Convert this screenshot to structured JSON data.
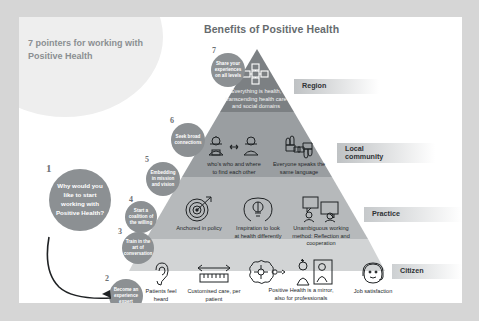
{
  "slide": {
    "deck_title": "Benefits of Positive Health",
    "left_heading": "7 pointers for working with Positive Health"
  },
  "pyramid": {
    "tiers": [
      {
        "id": "region",
        "label": "Region",
        "items": [
          {
            "icon": "network-nodes-icon",
            "caption": "Everything is health, transcending health care and social domains"
          }
        ]
      },
      {
        "id": "local-community",
        "label": "Local\ncommunity",
        "items": [
          {
            "icon": "two-people-icon",
            "caption": "who's who and where to find each other"
          },
          {
            "icon": "four-hands-icon",
            "caption": "Everyone speaks the same language"
          }
        ]
      },
      {
        "id": "practice",
        "label": "Practice",
        "items": [
          {
            "icon": "target-arrow-icon",
            "caption": "Anchored in policy"
          },
          {
            "icon": "head-lightbulb-icon",
            "caption": "Inspiration to look at health differently"
          },
          {
            "icon": "speech-bubbles-icon",
            "caption": "Unambiguous working method: Reflection and cooperation"
          }
        ]
      },
      {
        "id": "citizen",
        "label": "Citizen",
        "items": [
          {
            "icon": "ear-icon",
            "caption": "Patients feel heard"
          },
          {
            "icon": "ruler-arrows-icon",
            "caption": "Customised care, per patient"
          },
          {
            "icon": "brain-mirror-icon",
            "caption": "Positive Health is a mirror, also for professionals"
          },
          {
            "icon": "smiling-headset-face-icon",
            "caption": "Job satisfaction"
          }
        ]
      }
    ]
  },
  "pointers": [
    {
      "number": "1",
      "text": "Why would you like to start working with Positive Health?"
    },
    {
      "number": "2",
      "text": "Become an experience expert"
    },
    {
      "number": "3",
      "text": "Train in the art of conversation"
    },
    {
      "number": "4",
      "text": "Start a coalition of the willing"
    },
    {
      "number": "5",
      "text": "Embedding in mission and vision"
    },
    {
      "number": "6",
      "text": "Seek broad connections"
    },
    {
      "number": "7",
      "text": "Share your experiences on all levels"
    }
  ],
  "colors": {
    "tier_region": "#7c8083",
    "tier_local": "#9a9ea1",
    "tier_practice": "#b6b9bb",
    "tier_citizen": "#d2d4d5",
    "circle": "#8c9093",
    "title_text": "#666b6e",
    "heading_text": "#8b8f92",
    "slide_bg": "#ffffff",
    "matte_bg": "#d6d6d6"
  }
}
